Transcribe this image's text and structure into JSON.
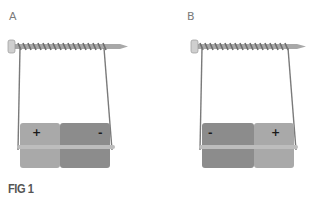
{
  "figure": {
    "caption": "FIG 1",
    "panels": [
      {
        "id": "A",
        "label": "A",
        "battery": {
          "left_terminal": "+",
          "right_terminal": "-"
        }
      },
      {
        "id": "B",
        "label": "B",
        "battery": {
          "left_terminal": "-",
          "right_terminal": "+"
        }
      }
    ]
  },
  "colors": {
    "nail": "#9a9a9a",
    "nail_head": "#c8c8c8",
    "coil": "#6e6e6e",
    "wire": "#777777",
    "battery_positive_half": "#a9a9a9",
    "battery_negative_half": "#8a8a8a",
    "battery_band": "#bdbdbd"
  }
}
